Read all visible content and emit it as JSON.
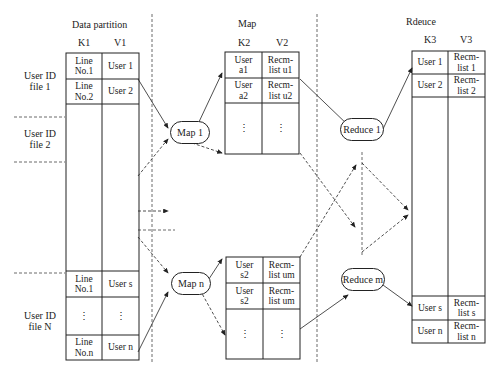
{
  "sections": {
    "data_partition": "Data partition",
    "map": "Map",
    "reduce": "Rdeuce"
  },
  "headers": {
    "k1": "K1",
    "v1": "V1",
    "k2": "K2",
    "v2": "V2",
    "k3": "K3",
    "v3": "V3"
  },
  "files": {
    "f1": [
      "User ID",
      "file 1"
    ],
    "f2": [
      "User ID",
      "file 2"
    ],
    "fN": [
      "User ID",
      "file N"
    ]
  },
  "partition_rows": {
    "top": [
      {
        "k": [
          "Line",
          "No.1"
        ],
        "v": "User 1"
      },
      {
        "k": [
          "Line",
          "No.2"
        ],
        "v": "User 2"
      }
    ],
    "bottom": [
      {
        "k": [
          "Line",
          "No.1"
        ],
        "v": "User s"
      },
      {
        "k": [
          "⋮"
        ],
        "v": "⋮"
      },
      {
        "k": [
          "Line",
          "No.n"
        ],
        "v": "User n"
      }
    ]
  },
  "map_nodes": {
    "m1": "Map 1",
    "mn": "Map n"
  },
  "map_table_top": [
    {
      "k": [
        "User",
        "a1"
      ],
      "v": [
        "Recm-",
        "list u1"
      ]
    },
    {
      "k": [
        "User",
        "a2"
      ],
      "v": [
        "Recm-",
        "list u2"
      ]
    },
    {
      "k": [
        "⋮"
      ],
      "v": [
        "⋮"
      ]
    }
  ],
  "map_table_bottom": [
    {
      "k": [
        "User",
        "s2"
      ],
      "v": [
        "Recm-",
        "list um"
      ]
    },
    {
      "k": [
        "User",
        "s2"
      ],
      "v": [
        "Recm-",
        "list um"
      ]
    },
    {
      "k": [
        "⋮"
      ],
      "v": [
        "⋮"
      ]
    }
  ],
  "reduce_nodes": {
    "r1": "Reduce 1",
    "rm": "Reduce m"
  },
  "reduce_table": [
    {
      "k": "User 1",
      "v": [
        "Recm-",
        "list 1"
      ]
    },
    {
      "k": "User 2",
      "v": [
        "Recm-",
        "list 2"
      ]
    },
    {
      "k": "User s",
      "v": [
        "Recm-",
        "list s"
      ]
    },
    {
      "k": "User n",
      "v": [
        "Recm-",
        "list n"
      ]
    }
  ]
}
